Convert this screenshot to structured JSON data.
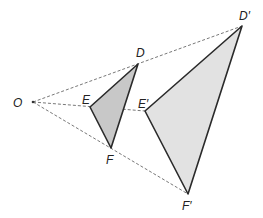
{
  "diagram": {
    "center": {
      "label": "O",
      "x": 33,
      "y": 102,
      "label_x": 13,
      "label_y": 107
    },
    "original": {
      "fill": "#c8c8c8",
      "stroke": "#2a2a2a",
      "points": [
        {
          "label": "D",
          "x": 138,
          "y": 64,
          "label_x": 136,
          "label_y": 57
        },
        {
          "label": "E",
          "x": 90,
          "y": 107,
          "label_x": 82,
          "label_y": 104
        },
        {
          "label": "F",
          "x": 111,
          "y": 148,
          "label_x": 106,
          "label_y": 164
        }
      ]
    },
    "image": {
      "fill": "#e2e2e2",
      "stroke": "#2a2a2a",
      "points": [
        {
          "label": "D′",
          "x": 242,
          "y": 26,
          "label_x": 239,
          "label_y": 20
        },
        {
          "label": "E′",
          "x": 145,
          "y": 111,
          "label_x": 138,
          "label_y": 108
        },
        {
          "label": "F′",
          "x": 188,
          "y": 194,
          "label_x": 182,
          "label_y": 210
        }
      ]
    },
    "rays": {
      "stroke": "#555555",
      "dash": "3,2"
    }
  }
}
